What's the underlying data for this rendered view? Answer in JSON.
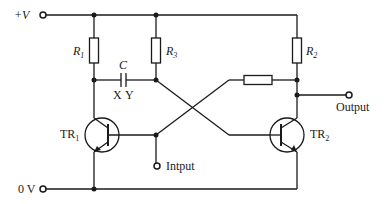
{
  "diagram": {
    "type": "circuit-schematic",
    "terminals": {
      "supply": "+V",
      "ground": "0 V",
      "input": "Intput",
      "output": "Output"
    },
    "components": {
      "r1": {
        "letter": "R",
        "sub": "1"
      },
      "r2": {
        "letter": "R",
        "sub": "2"
      },
      "r3": {
        "letter": "R",
        "sub": "3"
      },
      "cap": {
        "label": "C",
        "plate_x": "X",
        "plate_y": "Y"
      },
      "tr1": {
        "letter": "TR",
        "sub": "1"
      },
      "tr2": {
        "letter": "TR",
        "sub": "2"
      }
    },
    "colors": {
      "ink": "#1a1a1a",
      "background": "#ffffff"
    }
  }
}
